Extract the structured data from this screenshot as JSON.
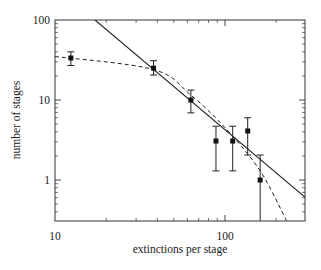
{
  "chart_data": {
    "type": "scatter",
    "title": "",
    "xlabel": "extinctions per stage",
    "ylabel": "number of stages",
    "xscale": "log",
    "yscale": "log",
    "xlim": [
      10,
      295
    ],
    "ylim": [
      0.31,
      100
    ],
    "x_tick_labels": [
      "10",
      "100"
    ],
    "y_tick_labels": [
      "1",
      "10",
      "100"
    ],
    "grid": false,
    "legend": null,
    "series": [
      {
        "name": "data",
        "kind": "points_with_error_bars",
        "points": [
          {
            "x": 12.4,
            "y": 33.5,
            "y_low": 27,
            "y_high": 40
          },
          {
            "x": 38,
            "y": 25,
            "y_low": 20.5,
            "y_high": 31
          },
          {
            "x": 63,
            "y": 10,
            "y_low": 6.9,
            "y_high": 13.3
          },
          {
            "x": 88.5,
            "y": 3.07,
            "y_low": 1.3,
            "y_high": 4.7
          },
          {
            "x": 111,
            "y": 3.07,
            "y_low": 1.3,
            "y_high": 4.7
          },
          {
            "x": 136,
            "y": 4.1,
            "y_low": 2.05,
            "y_high": 6.0
          },
          {
            "x": 161,
            "y": 1.0,
            "y_low": 0.31,
            "y_high": 2.05
          }
        ]
      },
      {
        "name": "power-law fit",
        "kind": "line",
        "style": "solid",
        "slope_loglog": -1.79,
        "x": [
          17.2,
          295
        ],
        "y": [
          100,
          0.61
        ]
      },
      {
        "name": "exponential-like fit",
        "kind": "line",
        "style": "dashed",
        "x": [
          10,
          38,
          63,
          100,
          161,
          230
        ],
        "y": [
          35,
          24,
          11.5,
          4.5,
          1.3,
          0.31
        ]
      }
    ]
  },
  "axes": {
    "x_ticks": [
      {
        "label": "10",
        "value": 10
      },
      {
        "label": "100",
        "value": 100
      }
    ],
    "y_ticks": [
      {
        "label": "100",
        "value": 100
      },
      {
        "label": "10",
        "value": 10
      },
      {
        "label": "1",
        "value": 1
      }
    ]
  },
  "labels": {
    "xlabel": "extinctions per stage",
    "ylabel": "number of stages"
  }
}
